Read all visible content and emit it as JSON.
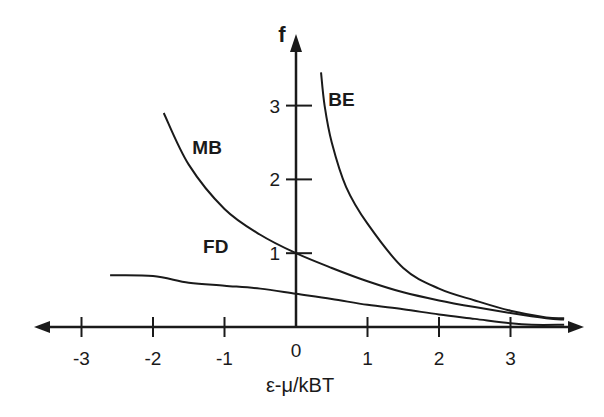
{
  "chart_data": {
    "type": "line",
    "title": "",
    "xlabel": "ε-μ/kBT",
    "ylabel": "f",
    "xlim": [
      -3.6,
      4.1
    ],
    "ylim": [
      0,
      3.9
    ],
    "grid": false,
    "legend_position": "inline labels",
    "x_ticks": [
      "-3",
      "-2",
      "-1",
      "0",
      "1",
      "2",
      "3"
    ],
    "y_ticks": [
      "1",
      "2",
      "3"
    ],
    "series": [
      {
        "name": "MB",
        "label_pos": [
          -1.45,
          2.35
        ],
        "x": [
          -1.85,
          -1.5,
          -1.0,
          -0.5,
          0.0,
          0.5,
          1.0,
          1.5,
          2.0,
          2.5,
          3.0,
          3.5,
          3.75
        ],
        "y": [
          2.9,
          2.2,
          1.6,
          1.25,
          1.0,
          0.8,
          0.62,
          0.47,
          0.36,
          0.27,
          0.19,
          0.12,
          0.1
        ]
      },
      {
        "name": "BE",
        "label_pos": [
          0.45,
          3.0
        ],
        "x": [
          0.35,
          0.4,
          0.5,
          0.7,
          1.0,
          1.5,
          2.0,
          2.5,
          3.0,
          3.5,
          3.75
        ],
        "y": [
          3.45,
          3.0,
          2.5,
          1.9,
          1.4,
          0.8,
          0.52,
          0.36,
          0.22,
          0.13,
          0.12
        ]
      },
      {
        "name": "FD",
        "label_pos": [
          -1.3,
          1.0
        ],
        "x": [
          -2.6,
          -2.0,
          -1.5,
          -1.0,
          -0.5,
          0.0,
          0.5,
          1.0,
          1.5,
          2.0,
          2.5,
          3.0,
          3.3,
          3.75
        ],
        "y": [
          0.7,
          0.69,
          0.6,
          0.56,
          0.52,
          0.45,
          0.38,
          0.3,
          0.24,
          0.17,
          0.11,
          0.05,
          0.03,
          0.03
        ]
      }
    ]
  },
  "axes": {
    "x_title": "ε-μ/kBT",
    "y_title": "f"
  }
}
